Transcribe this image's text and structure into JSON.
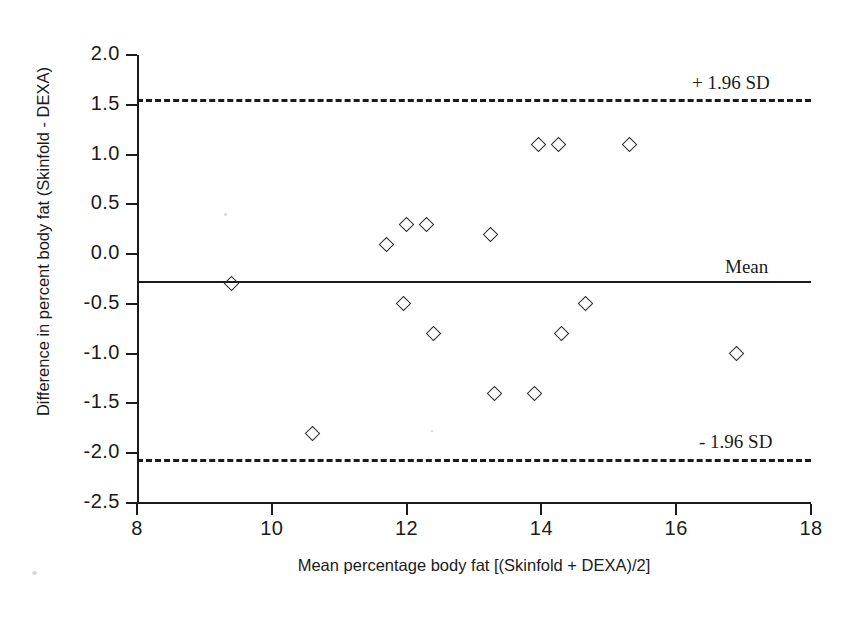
{
  "chart_data": {
    "type": "scatter",
    "title": "",
    "subtitle": "",
    "xlabel": "Mean percentage body fat [(Skinfold + DEXA)/2]",
    "ylabel": "Difference in percent body fat (Skinfold - DEXA)",
    "xlim": [
      8,
      18
    ],
    "ylim": [
      -2.5,
      2.0
    ],
    "grid": false,
    "legend_position": "none",
    "x_ticks": [
      "8",
      "10",
      "12",
      "14",
      "16",
      "18"
    ],
    "x_tick_values": [
      8,
      10,
      12,
      14,
      16,
      18
    ],
    "y_ticks": [
      "2.0",
      "1.5",
      "1.0",
      "0.5",
      "0.0",
      "-0.5",
      "-1.0",
      "-1.5",
      "-2.0",
      "-2.5"
    ],
    "y_tick_values": [
      2.0,
      1.5,
      1.0,
      0.5,
      0.0,
      -0.5,
      -1.0,
      -1.5,
      -2.0,
      -2.5
    ],
    "marker_style": "open-diamond",
    "series": [
      {
        "name": "Subject differences",
        "points": [
          {
            "x": 9.4,
            "y": -0.3
          },
          {
            "x": 10.6,
            "y": -1.8
          },
          {
            "x": 11.7,
            "y": 0.1
          },
          {
            "x": 11.95,
            "y": -0.5
          },
          {
            "x": 12.0,
            "y": 0.3
          },
          {
            "x": 12.3,
            "y": 0.3
          },
          {
            "x": 12.4,
            "y": -0.8
          },
          {
            "x": 13.25,
            "y": 0.2
          },
          {
            "x": 13.3,
            "y": -1.4
          },
          {
            "x": 13.9,
            "y": -1.4
          },
          {
            "x": 13.95,
            "y": 1.1
          },
          {
            "x": 14.25,
            "y": 1.1
          },
          {
            "x": 14.3,
            "y": -0.8
          },
          {
            "x": 14.65,
            "y": -0.5
          },
          {
            "x": 15.3,
            "y": 1.1
          },
          {
            "x": 16.9,
            "y": -1.0
          }
        ]
      }
    ],
    "reference_lines": [
      {
        "id": "upper-loa",
        "label": "+ 1.96 SD",
        "value": 1.55,
        "style": "dashed"
      },
      {
        "id": "mean",
        "label": "Mean",
        "value": -0.28,
        "style": "solid"
      },
      {
        "id": "lower-loa",
        "label": "- 1.96 SD",
        "value": -2.07,
        "style": "dashed"
      }
    ],
    "colors": {
      "axis": "#1b1b1b",
      "marker_edge": "#2a2a2a",
      "reference_line": "#1b1b1b",
      "background": "#ffffff"
    }
  }
}
